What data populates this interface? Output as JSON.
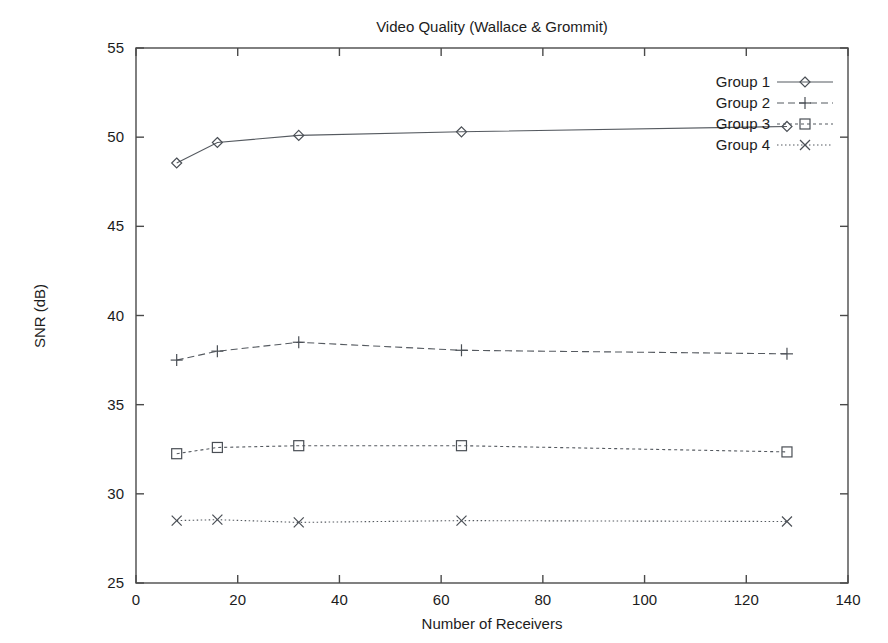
{
  "chart_data": {
    "type": "line",
    "title": "Video Quality (Wallace & Grommit)",
    "xlabel": "Number of Receivers",
    "ylabel": "SNR (dB)",
    "xlim": [
      0,
      140
    ],
    "ylim": [
      25,
      55
    ],
    "xticks": [
      0,
      20,
      40,
      60,
      80,
      100,
      120,
      140
    ],
    "yticks": [
      25,
      30,
      35,
      40,
      45,
      50,
      55
    ],
    "grid": false,
    "legend_position": "top-right",
    "x": [
      8,
      16,
      32,
      64,
      128
    ],
    "series": [
      {
        "name": "Group 1",
        "values": [
          48.55,
          49.7,
          50.1,
          50.3,
          50.6
        ],
        "marker": "diamond",
        "linestyle": "solid"
      },
      {
        "name": "Group 2",
        "values": [
          37.5,
          38.0,
          38.5,
          38.05,
          37.85
        ],
        "marker": "plus",
        "linestyle": "dashed"
      },
      {
        "name": "Group 3",
        "values": [
          32.25,
          32.6,
          32.7,
          32.7,
          32.35
        ],
        "marker": "square",
        "linestyle": "dashdot"
      },
      {
        "name": "Group 4",
        "values": [
          28.5,
          28.55,
          28.4,
          28.5,
          28.45
        ],
        "marker": "cross",
        "linestyle": "dotted"
      }
    ]
  },
  "labels": {
    "title": "Video Quality (Wallace & Grommit)",
    "xlabel": "Number of Receivers",
    "ylabel": "SNR (dB)",
    "xticks": [
      "0",
      "20",
      "40",
      "60",
      "80",
      "100",
      "120",
      "140"
    ],
    "yticks": [
      "55",
      "50",
      "45",
      "40",
      "35",
      "30",
      "25"
    ],
    "legend": [
      "Group 1",
      "Group 2",
      "Group 3",
      "Group 4"
    ]
  },
  "colors": {
    "background": "#ffffff",
    "axis": "#4a4a4a",
    "series": "#555a60",
    "text": "#1c1c1c"
  }
}
